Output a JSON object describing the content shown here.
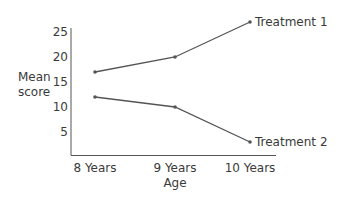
{
  "chart_data": {
    "type": "line",
    "title": "",
    "xlabel": "Age",
    "ylabel": "Mean score",
    "ylabel_lines": [
      "Mean",
      "score"
    ],
    "categories": [
      "8 Years",
      "9 Years",
      "10 Years"
    ],
    "yticks": [
      5,
      10,
      15,
      20,
      25
    ],
    "ylim": [
      0,
      27
    ],
    "grid": false,
    "legend_position": "inline-end-of-line",
    "series": [
      {
        "name": "Treatment 1",
        "values": [
          17,
          20,
          27
        ]
      },
      {
        "name": "Treatment 2",
        "values": [
          12,
          10,
          3
        ]
      }
    ],
    "colors": {
      "line": "#555555",
      "axis": "#555555",
      "text": "#3a3a3a"
    }
  }
}
